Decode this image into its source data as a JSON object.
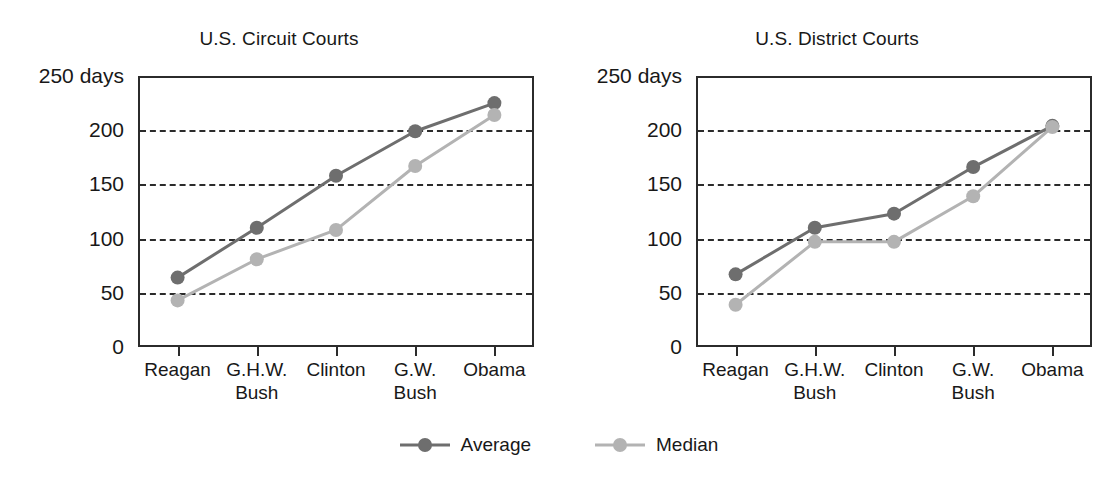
{
  "chart_data": [
    {
      "type": "line",
      "title": "U.S. Circuit Courts",
      "xlabel": "",
      "ylabel": "",
      "ylim": [
        0,
        250
      ],
      "yticks": [
        0,
        50,
        100,
        150,
        200,
        250
      ],
      "ytick_labels": [
        "0",
        "50",
        "100",
        "150",
        "200",
        "250 days"
      ],
      "grid": "horizontal-dashed",
      "legend_position": "bottom-center",
      "categories": [
        "Reagan",
        "G.H.W. Bush",
        "Clinton",
        "G.W. Bush",
        "Obama"
      ],
      "category_lines": [
        [
          "Reagan"
        ],
        [
          "G.H.W.",
          "Bush"
        ],
        [
          "Clinton"
        ],
        [
          "G.W.",
          "Bush"
        ],
        [
          "Obama"
        ]
      ],
      "series": [
        {
          "name": "Average",
          "color": "#6e6e6e",
          "values": [
            64,
            110,
            158,
            199,
            225
          ]
        },
        {
          "name": "Median",
          "color": "#b3b3b3",
          "values": [
            43,
            81,
            108,
            167,
            214
          ]
        }
      ]
    },
    {
      "type": "line",
      "title": "U.S. District Courts",
      "xlabel": "",
      "ylabel": "",
      "ylim": [
        0,
        250
      ],
      "yticks": [
        0,
        50,
        100,
        150,
        200,
        250
      ],
      "ytick_labels": [
        "0",
        "50",
        "100",
        "150",
        "200",
        "250 days"
      ],
      "grid": "horizontal-dashed",
      "legend_position": "bottom-center",
      "categories": [
        "Reagan",
        "G.H.W. Bush",
        "Clinton",
        "G.W. Bush",
        "Obama"
      ],
      "category_lines": [
        [
          "Reagan"
        ],
        [
          "G.H.W.",
          "Bush"
        ],
        [
          "Clinton"
        ],
        [
          "G.W.",
          "Bush"
        ],
        [
          "Obama"
        ]
      ],
      "series": [
        {
          "name": "Average",
          "color": "#6e6e6e",
          "values": [
            67,
            110,
            123,
            166,
            204
          ]
        },
        {
          "name": "Median",
          "color": "#b3b3b3",
          "values": [
            39,
            97,
            97,
            139,
            203
          ]
        }
      ]
    }
  ],
  "legend": {
    "items": [
      {
        "label": "Average",
        "color": "#6e6e6e"
      },
      {
        "label": "Median",
        "color": "#b3b3b3"
      }
    ]
  },
  "colors": {
    "average": "#6e6e6e",
    "median": "#b3b3b3",
    "axis": "#2b2b2b",
    "text": "#181818",
    "background": "#ffffff"
  }
}
